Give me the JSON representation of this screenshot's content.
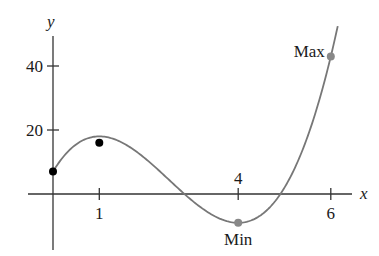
{
  "chart_data": {
    "type": "line",
    "title": "",
    "xlabel": "x",
    "ylabel": "y",
    "function": "f(x) = 2x^3 - 15x^2 + 24x + 7",
    "x_ticks": [
      {
        "value": 1,
        "label": "1"
      },
      {
        "value": 4,
        "label": "4"
      },
      {
        "value": 6,
        "label": "6"
      }
    ],
    "y_ticks": [
      {
        "value": 20,
        "label": "20"
      },
      {
        "value": 40,
        "label": "40"
      }
    ],
    "xlim": [
      -0.5,
      6.3
    ],
    "ylim": [
      -18,
      52
    ],
    "grid": false,
    "series": [
      {
        "name": "f(x)",
        "color": "#777777",
        "domain": [
          0,
          6.15
        ]
      }
    ],
    "points": [
      {
        "x": 0,
        "y": 7,
        "color": "#000000",
        "label": ""
      },
      {
        "x": 1,
        "y": 16,
        "color": "#000000",
        "label": ""
      },
      {
        "x": 4,
        "y": -9,
        "color": "#888888",
        "label": "Min"
      },
      {
        "x": 6,
        "y": 43,
        "color": "#888888",
        "label": "Max"
      }
    ],
    "annotations": [
      {
        "text": "Min",
        "x": 4,
        "y": -9,
        "position": "below"
      },
      {
        "text": "Max",
        "x": 6,
        "y": 43,
        "position": "left"
      }
    ]
  }
}
